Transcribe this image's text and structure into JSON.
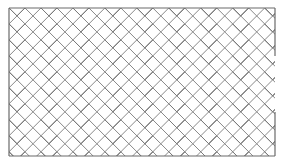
{
  "figure": {
    "line_color": "#7a7a7a",
    "frame_color": "#6a6a6a",
    "background": "#ffffff"
  }
}
